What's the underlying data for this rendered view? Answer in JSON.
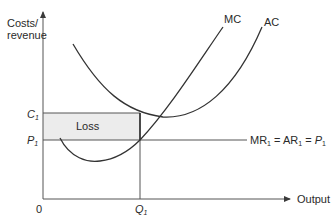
{
  "diagram": {
    "y_axis_label_line1": "Costs/",
    "y_axis_label_line2": "revenue",
    "x_axis_label": "Output",
    "origin_label": "0",
    "curves": {
      "mc_label": "MC",
      "ac_label": "AC",
      "demand_label_parts": [
        "MR",
        "1",
        " = AR",
        "1",
        " = ",
        "P",
        "1"
      ]
    },
    "levels": {
      "c1_label": "C",
      "c1_sub": "1",
      "p1_label": "P",
      "p1_sub": "1",
      "q1_label": "Q",
      "q1_sub": "1"
    },
    "loss_area_label": "Loss",
    "colors": {
      "line": "#3a3a3a",
      "axis": "#555555",
      "loss_fill": "#ececec",
      "text": "#2a2a2a"
    }
  }
}
